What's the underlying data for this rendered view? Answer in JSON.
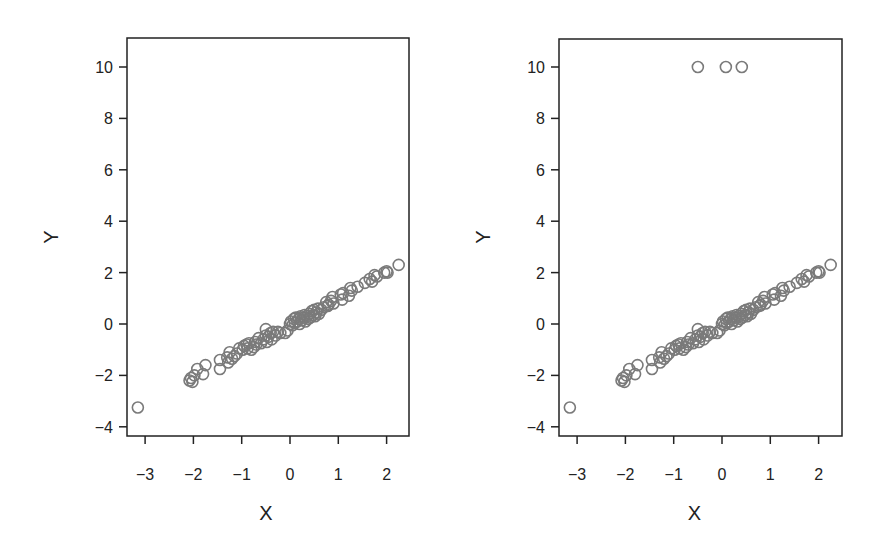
{
  "chart_data": [
    {
      "type": "scatter",
      "title": "",
      "xlabel": "X",
      "ylabel": "Y",
      "xlim": [
        -3.4,
        2.5
      ],
      "ylim": [
        -4.4,
        11.1
      ],
      "xticks": [
        -3,
        -2,
        -1,
        0,
        1,
        2
      ],
      "yticks": [
        -4,
        -2,
        0,
        2,
        4,
        6,
        8,
        10
      ],
      "grid": false,
      "marker": "open-circle",
      "color": "#7a7a7a",
      "points": [
        [
          -3.15,
          -3.25
        ],
        [
          -2.08,
          -2.2
        ],
        [
          -2.05,
          -2.1
        ],
        [
          -2.02,
          -2.25
        ],
        [
          -1.98,
          -2.0
        ],
        [
          -1.92,
          -1.75
        ],
        [
          -1.8,
          -1.95
        ],
        [
          -1.75,
          -1.6
        ],
        [
          -1.45,
          -1.75
        ],
        [
          -1.45,
          -1.4
        ],
        [
          -1.3,
          -1.3
        ],
        [
          -1.28,
          -1.5
        ],
        [
          -1.25,
          -1.1
        ],
        [
          -1.2,
          -1.35
        ],
        [
          -1.15,
          -1.25
        ],
        [
          -1.1,
          -1.15
        ],
        [
          -1.05,
          -0.95
        ],
        [
          -0.98,
          -1.0
        ],
        [
          -0.95,
          -0.85
        ],
        [
          -0.9,
          -0.8
        ],
        [
          -0.88,
          -0.95
        ],
        [
          -0.85,
          -0.75
        ],
        [
          -0.8,
          -1.0
        ],
        [
          -0.75,
          -0.9
        ],
        [
          -0.72,
          -0.7
        ],
        [
          -0.7,
          -0.8
        ],
        [
          -0.65,
          -0.55
        ],
        [
          -0.6,
          -0.75
        ],
        [
          -0.55,
          -0.6
        ],
        [
          -0.5,
          -0.45
        ],
        [
          -0.5,
          -0.2
        ],
        [
          -0.48,
          -0.7
        ],
        [
          -0.45,
          -0.5
        ],
        [
          -0.4,
          -0.35
        ],
        [
          -0.38,
          -0.6
        ],
        [
          -0.35,
          -0.3
        ],
        [
          -0.3,
          -0.45
        ],
        [
          -0.25,
          -0.3
        ],
        [
          -0.2,
          -0.35
        ],
        [
          -0.1,
          -0.35
        ],
        [
          -0.05,
          -0.25
        ],
        [
          0.0,
          0.0
        ],
        [
          0.02,
          0.1
        ],
        [
          0.05,
          -0.05
        ],
        [
          0.08,
          0.2
        ],
        [
          0.1,
          0.05
        ],
        [
          0.12,
          0.25
        ],
        [
          0.15,
          0.1
        ],
        [
          0.18,
          0.2
        ],
        [
          0.2,
          0.0
        ],
        [
          0.22,
          0.3
        ],
        [
          0.25,
          0.15
        ],
        [
          0.28,
          0.25
        ],
        [
          0.3,
          0.35
        ],
        [
          0.32,
          0.1
        ],
        [
          0.35,
          0.3
        ],
        [
          0.38,
          0.2
        ],
        [
          0.4,
          0.4
        ],
        [
          0.42,
          0.25
        ],
        [
          0.45,
          0.5
        ],
        [
          0.48,
          0.35
        ],
        [
          0.5,
          0.55
        ],
        [
          0.52,
          0.3
        ],
        [
          0.55,
          0.45
        ],
        [
          0.58,
          0.6
        ],
        [
          0.6,
          0.4
        ],
        [
          0.65,
          0.55
        ],
        [
          0.7,
          0.65
        ],
        [
          0.75,
          0.85
        ],
        [
          0.78,
          0.7
        ],
        [
          0.8,
          0.75
        ],
        [
          0.85,
          0.9
        ],
        [
          0.88,
          1.05
        ],
        [
          0.9,
          0.8
        ],
        [
          1.05,
          1.15
        ],
        [
          1.08,
          0.95
        ],
        [
          1.1,
          1.2
        ],
        [
          1.22,
          1.1
        ],
        [
          1.25,
          1.4
        ],
        [
          1.28,
          1.3
        ],
        [
          1.4,
          1.45
        ],
        [
          1.55,
          1.6
        ],
        [
          1.65,
          1.75
        ],
        [
          1.7,
          1.65
        ],
        [
          1.75,
          1.9
        ],
        [
          1.8,
          1.85
        ],
        [
          1.95,
          2.0
        ],
        [
          2.0,
          2.05
        ],
        [
          2.02,
          2.0
        ],
        [
          2.25,
          2.3
        ]
      ]
    },
    {
      "type": "scatter",
      "title": "",
      "xlabel": "X",
      "ylabel": "Y",
      "xlim": [
        -3.4,
        2.5
      ],
      "ylim": [
        -4.4,
        11.1
      ],
      "xticks": [
        -3,
        -2,
        -1,
        0,
        1,
        2
      ],
      "yticks": [
        -4,
        -2,
        0,
        2,
        4,
        6,
        8,
        10
      ],
      "grid": false,
      "marker": "open-circle",
      "color": "#7a7a7a",
      "note": "same points as left panel plus three outliers at Y=10",
      "outliers": [
        [
          -0.5,
          10
        ],
        [
          0.08,
          10
        ],
        [
          0.41,
          10
        ]
      ]
    }
  ],
  "panels": [
    {
      "xlabel": "X",
      "ylabel": "Y",
      "xticks": [
        "-3",
        "-2",
        "-1",
        "0",
        "1",
        "2"
      ],
      "yticks": [
        "-4",
        "-2",
        "0",
        "2",
        "4",
        "6",
        "8",
        "10"
      ]
    },
    {
      "xlabel": "X",
      "ylabel": "Y",
      "xticks": [
        "-3",
        "-2",
        "-1",
        "0",
        "1",
        "2"
      ],
      "yticks": [
        "-4",
        "-2",
        "0",
        "2",
        "4",
        "6",
        "8",
        "10"
      ]
    }
  ]
}
